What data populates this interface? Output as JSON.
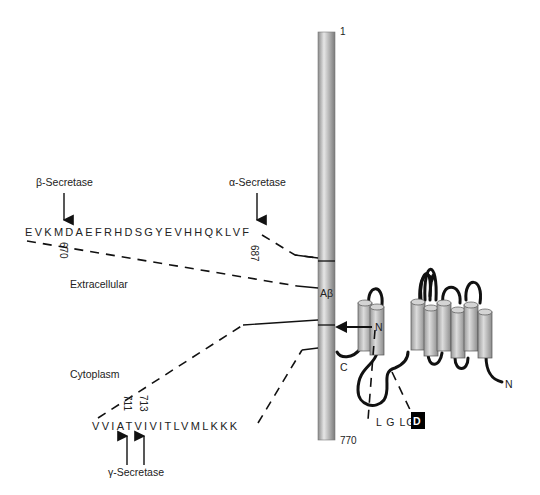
{
  "figure": {
    "app_rod": {
      "n_terminus_label": "1",
      "c_terminus_label": "770",
      "abeta_label": "Aβ"
    },
    "regions": {
      "extracellular": "Extracellular",
      "cytoplasm": "Cytoplasm"
    },
    "secretases": {
      "beta": "β-Secretase",
      "alpha": "α-Secretase",
      "gamma": "γ-Secretase"
    },
    "sequences": {
      "extracellular_seq": "EVKMDAEFRHDSGYEVHHQKLVF",
      "transmembrane_seq": "VVIATVIVITLVMLKKK"
    },
    "residue_numbers": {
      "r670": "670",
      "r687": "687",
      "r711": "711",
      "r713": "713"
    },
    "presenilin": {
      "n_label": "N",
      "c_label": "C",
      "n_term_label": "N",
      "motif_text": "L G LG",
      "motif_highlight": "D"
    },
    "colors": {
      "rod": "#a8a8a8",
      "helix": "#b5b5b5",
      "line": "#111111",
      "lipid": "#777777",
      "highlight_bg": "#000000"
    }
  }
}
